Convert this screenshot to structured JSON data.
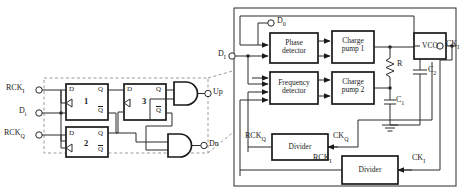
{
  "diagram": {
    "colors": {
      "ink": "#1a1a1a",
      "wire": "#2b2b2b",
      "dashed": "#9a9a9a",
      "background": "#ffffff"
    }
  },
  "detector_block": {
    "inputs": [
      {
        "id": "rck_i",
        "label": "RCK",
        "sub": "I"
      },
      {
        "id": "d_i",
        "label": "D",
        "sub": "i"
      },
      {
        "id": "rck_q",
        "label": "RCK",
        "sub": "Q"
      }
    ],
    "outputs": [
      {
        "id": "up",
        "label": "Up"
      },
      {
        "id": "dn",
        "label": "Dn"
      }
    ],
    "flipflops": [
      {
        "id": "ff1",
        "number": "1",
        "pins": {
          "d": "D",
          "q": "Q",
          "qbar": "Q"
        }
      },
      {
        "id": "ff2",
        "number": "2",
        "pins": {
          "d": "D",
          "q": "Q",
          "qbar": "Q"
        }
      },
      {
        "id": "ff3",
        "number": "3",
        "pins": {
          "d": "D",
          "q": "Q",
          "qbar": "Q"
        }
      }
    ],
    "gates": [
      {
        "id": "and-up",
        "type": "and-gate"
      },
      {
        "id": "and-dn",
        "type": "and-gate"
      }
    ]
  },
  "pll": {
    "blocks": [
      {
        "id": "phase-detector",
        "line1": "Phase",
        "line2": "detector"
      },
      {
        "id": "frequency-detector",
        "line1": "Frequency",
        "line2": "detector"
      },
      {
        "id": "charge-pump-1",
        "line1": "Charge",
        "line2": "pump 1"
      },
      {
        "id": "charge-pump-2",
        "line1": "Charge",
        "line2": "pump 2"
      },
      {
        "id": "vco",
        "line1": "VCO",
        "line2": ""
      },
      {
        "id": "divider-q",
        "line1": "Divider",
        "line2": ""
      },
      {
        "id": "divider-i",
        "line1": "Divider",
        "line2": ""
      }
    ],
    "passives": [
      {
        "id": "resistor-r",
        "label": "R",
        "sub": ""
      },
      {
        "id": "capacitor-c1",
        "label": "C",
        "sub": "1"
      },
      {
        "id": "capacitor-c2",
        "label": "C",
        "sub": "2"
      }
    ],
    "ports": [
      {
        "id": "d0",
        "label": "D",
        "sub": "0"
      },
      {
        "id": "d_i_pll",
        "label": "D",
        "sub": "I"
      },
      {
        "id": "ck_i_out",
        "label": "CK",
        "sub": "I"
      }
    ],
    "nets": [
      {
        "id": "rck_q_net",
        "label": "RCK",
        "sub": "Q"
      },
      {
        "id": "ck_q_net",
        "label": "CK",
        "sub": "Q"
      },
      {
        "id": "rck_i_net",
        "label": "RCK",
        "sub": "I"
      },
      {
        "id": "ck_i_net",
        "label": "CK",
        "sub": "I"
      }
    ]
  }
}
